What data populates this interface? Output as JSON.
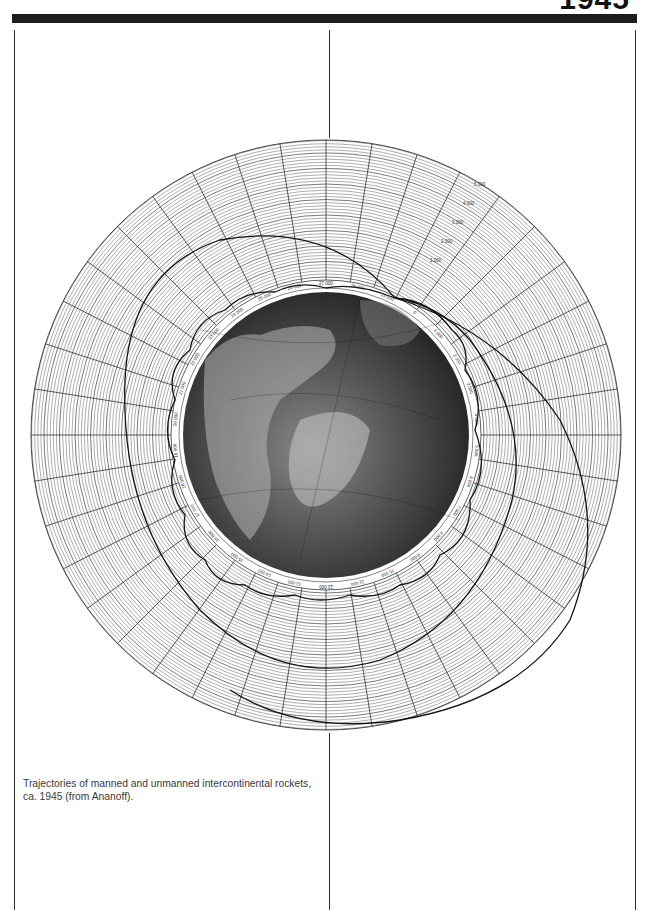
{
  "page": {
    "heading": "1945",
    "caption": "Trajectories of manned and unmanned intercontinental rockets, ca. 1945 (from Ananoff)."
  },
  "figure": {
    "type": "polar trajectory diagram",
    "ring_tick_labels": [
      "0",
      "1 000",
      "2 000",
      "3 000",
      "4 000",
      "5 000",
      "6 000",
      "7 000",
      "8 000",
      "9 000",
      "10 000",
      "11 000",
      "12 000",
      "13 000",
      "14 000",
      "15 000",
      "16 000",
      "17 000",
      "18 000",
      "19 000",
      "20 000",
      "21 000",
      "22 000",
      "23 000",
      "24 000",
      "25 000",
      "26 000",
      "27 000",
      "28 000",
      "29 000"
    ],
    "altitude_labels": [
      "1 000",
      "2 000",
      "3 000",
      "4 000",
      "5 000"
    ],
    "trajectories": [
      {
        "name": "orbital-loop-trajectory",
        "description": "wavy near-circular path just above the label ring"
      },
      {
        "name": "inner-elliptical-trajectory",
        "description": "large loop from top-right launch point around the left side"
      },
      {
        "name": "outer-elliptical-trajectory",
        "description": "wide ellipse extending to the lower right"
      }
    ],
    "colors": {
      "grid": "#555555",
      "trajectory": "#1a1a1a",
      "globe_dark": "#2b2b2b",
      "globe_light": "#9a9a9a",
      "band": "#1c1c1c"
    }
  }
}
